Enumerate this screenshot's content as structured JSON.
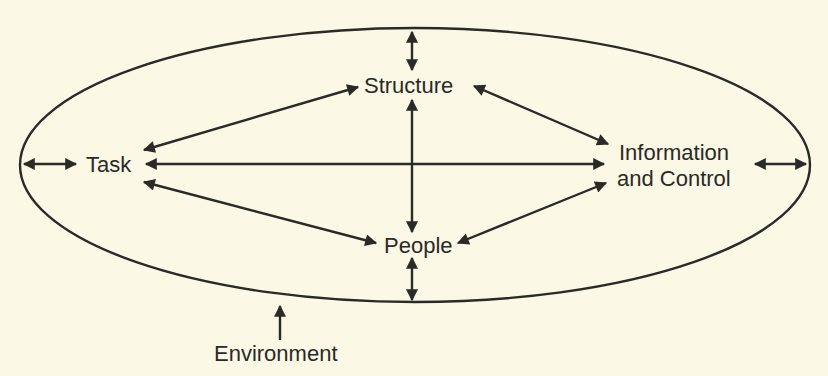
{
  "diagram": {
    "type": "systems-model",
    "background_color": "#fbf8e6",
    "ink_color": "#2a2a26",
    "boundary": {
      "shape": "ellipse",
      "label": "Environment"
    },
    "nodes": [
      {
        "id": "task",
        "label": "Task"
      },
      {
        "id": "structure",
        "label": "Structure"
      },
      {
        "id": "people",
        "label": "People"
      },
      {
        "id": "info",
        "label_line1": "Information",
        "label_line2": "and Control"
      }
    ],
    "edges": [
      {
        "from": "task",
        "to": "structure",
        "type": "bidirectional"
      },
      {
        "from": "task",
        "to": "info",
        "type": "bidirectional"
      },
      {
        "from": "task",
        "to": "people",
        "type": "bidirectional"
      },
      {
        "from": "structure",
        "to": "people",
        "type": "bidirectional"
      },
      {
        "from": "structure",
        "to": "info",
        "type": "bidirectional"
      },
      {
        "from": "people",
        "to": "info",
        "type": "bidirectional"
      },
      {
        "from": "task",
        "to": "environment",
        "type": "bidirectional"
      },
      {
        "from": "structure",
        "to": "environment",
        "type": "bidirectional"
      },
      {
        "from": "people",
        "to": "environment",
        "type": "bidirectional"
      },
      {
        "from": "info",
        "to": "environment",
        "type": "bidirectional"
      }
    ]
  }
}
